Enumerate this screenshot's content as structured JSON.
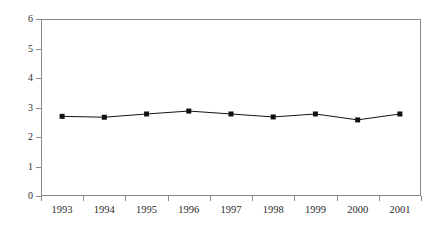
{
  "chart_data": {
    "type": "line",
    "title": "",
    "subtitle": "",
    "xlabel": "",
    "ylabel": "",
    "categories": [
      "1993",
      "1994",
      "1995",
      "1996",
      "1997",
      "1998",
      "1999",
      "2000",
      "2001"
    ],
    "values": [
      2.7,
      2.67,
      2.78,
      2.88,
      2.78,
      2.68,
      2.78,
      2.58,
      2.78
    ],
    "series": [
      {
        "name": "series-1",
        "values": [
          2.7,
          2.67,
          2.78,
          2.88,
          2.78,
          2.68,
          2.78,
          2.58,
          2.78
        ],
        "line_color": "#141414",
        "marker_color": "#111111",
        "marker": "square"
      }
    ],
    "ylim": [
      0,
      6
    ],
    "y_ticks": [
      0,
      1,
      2,
      3,
      4,
      5,
      6
    ],
    "y_tick_labels": [
      "0",
      "1",
      "2",
      "3",
      "4",
      "5",
      "6"
    ],
    "grid": false,
    "legend": false,
    "legend_position": "none",
    "frame": true,
    "annotations": []
  },
  "colors": {
    "background": "#ffffff",
    "axis": "#8a8a8a",
    "text": "#2b2b2b",
    "series": "#141414"
  }
}
